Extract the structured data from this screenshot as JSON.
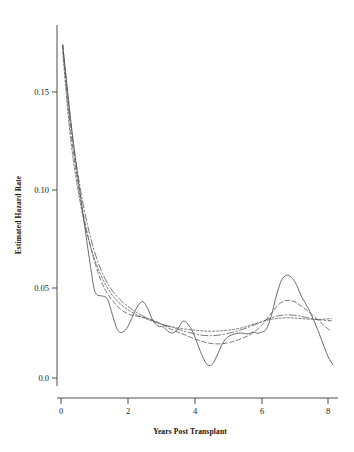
{
  "chart_data": {
    "type": "line",
    "title": "",
    "xlabel": "Years Post Transplant",
    "ylabel": "Estimated Hazard Rate",
    "xlim": [
      -0.35,
      8.45
    ],
    "ylim": [
      -0.012,
      0.192
    ],
    "xticks": [
      0,
      2,
      4,
      6,
      8
    ],
    "xtick_labels": [
      "0",
      "2",
      "4",
      "6",
      "8"
    ],
    "yticks": [
      0.0,
      0.05,
      0.1,
      0.15
    ],
    "ytick_labels": [
      "0.0",
      "0.05",
      "0.10",
      "0.15"
    ],
    "grid": false,
    "legend": "none",
    "series": [
      {
        "name": "narrow-bandwidth kernel smooth",
        "style": "solid",
        "color": "#525252",
        "x": [
          0.05,
          0.15,
          0.3,
          0.45,
          0.6,
          0.75,
          0.9,
          1.0,
          1.1,
          1.25,
          1.4,
          1.55,
          1.7,
          1.85,
          2.0,
          2.15,
          2.3,
          2.45,
          2.6,
          2.75,
          2.9,
          3.05,
          3.2,
          3.35,
          3.5,
          3.65,
          3.8,
          3.95,
          4.1,
          4.25,
          4.4,
          4.55,
          4.7,
          4.85,
          5.0,
          5.2,
          5.4,
          5.6,
          5.75,
          5.9,
          6.0,
          6.15,
          6.3,
          6.45,
          6.6,
          6.75,
          6.9,
          7.05,
          7.2,
          7.4,
          7.6,
          7.8,
          8.0,
          8.15
        ],
        "y": [
          0.185,
          0.168,
          0.142,
          0.119,
          0.099,
          0.079,
          0.06,
          0.049,
          0.046,
          0.0455,
          0.0435,
          0.0345,
          0.0265,
          0.0255,
          0.0285,
          0.0345,
          0.04,
          0.0425,
          0.0385,
          0.032,
          0.029,
          0.0285,
          0.026,
          0.025,
          0.0272,
          0.0315,
          0.03,
          0.0255,
          0.0185,
          0.0115,
          0.0072,
          0.008,
          0.0135,
          0.0195,
          0.0228,
          0.0245,
          0.025,
          0.0245,
          0.0255,
          0.0248,
          0.0255,
          0.027,
          0.0345,
          0.0455,
          0.054,
          0.057,
          0.056,
          0.052,
          0.0455,
          0.039,
          0.031,
          0.0215,
          0.012,
          0.0072
        ]
      },
      {
        "name": "medium-bandwidth kernel smooth",
        "style": "dashed",
        "color": "#555555",
        "x": [
          0.05,
          0.3,
          0.6,
          0.9,
          1.2,
          1.5,
          1.8,
          2.1,
          2.4,
          2.7,
          3.0,
          3.3,
          3.6,
          3.9,
          4.2,
          4.5,
          4.8,
          5.1,
          5.4,
          5.7,
          6.0,
          6.3,
          6.6,
          6.9,
          7.2,
          7.5,
          7.8,
          8.05
        ],
        "y": [
          0.185,
          0.136,
          0.098,
          0.072,
          0.054,
          0.044,
          0.038,
          0.035,
          0.034,
          0.0325,
          0.03,
          0.027,
          0.0248,
          0.0225,
          0.0205,
          0.0192,
          0.019,
          0.02,
          0.0218,
          0.0245,
          0.029,
          0.036,
          0.042,
          0.043,
          0.04,
          0.0355,
          0.0305,
          0.0265
        ]
      },
      {
        "name": "wide-bandwidth kernel smooth",
        "style": "dashdot",
        "color": "#555555",
        "x": [
          0.05,
          0.3,
          0.6,
          0.9,
          1.2,
          1.5,
          1.8,
          2.1,
          2.4,
          2.7,
          3.0,
          3.3,
          3.6,
          3.9,
          4.2,
          4.5,
          4.8,
          5.1,
          5.4,
          5.7,
          6.0,
          6.3,
          6.6,
          6.9,
          7.2,
          7.5,
          7.8,
          8.1
        ],
        "y": [
          0.185,
          0.14,
          0.103,
          0.077,
          0.06,
          0.0495,
          0.043,
          0.0385,
          0.035,
          0.0322,
          0.03,
          0.0282,
          0.0265,
          0.025,
          0.0238,
          0.0235,
          0.024,
          0.0252,
          0.0268,
          0.0288,
          0.031,
          0.0335,
          0.0348,
          0.035,
          0.0342,
          0.033,
          0.0322,
          0.0318
        ]
      },
      {
        "name": "widest-bandwidth kernel smooth",
        "style": "longdash",
        "color": "#5a5a5a",
        "x": [
          0.05,
          0.3,
          0.6,
          0.9,
          1.2,
          1.5,
          1.8,
          2.1,
          2.4,
          2.7,
          3.0,
          3.3,
          3.6,
          3.9,
          4.2,
          4.5,
          4.8,
          5.1,
          5.4,
          5.7,
          6.0,
          6.3,
          6.6,
          6.9,
          7.2,
          7.5,
          7.8,
          8.1
        ],
        "y": [
          0.181,
          0.131,
          0.095,
          0.072,
          0.057,
          0.047,
          0.0408,
          0.0368,
          0.034,
          0.0318,
          0.03,
          0.0286,
          0.0275,
          0.0268,
          0.0262,
          0.026,
          0.0262,
          0.0268,
          0.0278,
          0.0295,
          0.0312,
          0.0326,
          0.0333,
          0.0334,
          0.033,
          0.0326,
          0.0326,
          0.033
        ]
      }
    ]
  },
  "axes": {
    "x_axis_name": "Years Post Transplant",
    "y_axis_name": "Estimated Hazard Rate"
  }
}
